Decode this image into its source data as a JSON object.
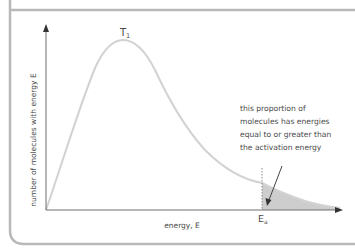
{
  "diagram": {
    "curve_label": "T",
    "curve_label_subscript": "1",
    "x_axis_label": "energy, E",
    "y_axis_label": "number of molecules with energy E",
    "ea_label": "E",
    "ea_label_subscript": "a",
    "annotation_lines": [
      "this proportion of",
      "molecules has energies",
      "equal to or greater than",
      "the activation energy"
    ]
  },
  "colors": {
    "frame": "#b8b8b8",
    "axis": "#6e6e6e",
    "curve": "#d2d2d2",
    "shade": "#c8c8c8",
    "text": "#4a4a4a",
    "arrow": "#444444"
  }
}
